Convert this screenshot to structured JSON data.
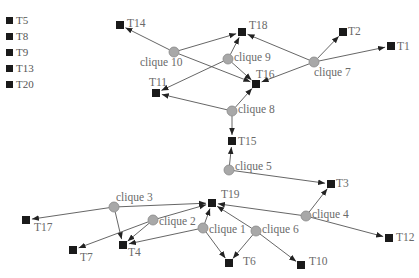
{
  "legend": {
    "items": [
      {
        "label": "T5"
      },
      {
        "label": "T8"
      },
      {
        "label": "T9"
      },
      {
        "label": "T13"
      },
      {
        "label": "T20"
      }
    ]
  },
  "colors": {
    "task_node": "#1a1a1a",
    "clique_node": "#a8a8a8",
    "clique_stroke": "#888888",
    "edge": "#555555",
    "label": "#6a6a6a"
  },
  "task_nodes": [
    {
      "id": "T1",
      "label": "T1",
      "x": 391,
      "y": 46,
      "lx": 397,
      "ly": 50,
      "anchor": "start"
    },
    {
      "id": "T2",
      "label": "T2",
      "x": 343,
      "y": 32,
      "lx": 348,
      "ly": 35,
      "anchor": "start"
    },
    {
      "id": "T3",
      "label": "T3",
      "x": 331,
      "y": 184,
      "lx": 336,
      "ly": 187,
      "anchor": "start"
    },
    {
      "id": "T4",
      "label": "T4",
      "x": 123,
      "y": 245,
      "lx": 128,
      "ly": 256,
      "anchor": "start"
    },
    {
      "id": "T6",
      "label": "T6",
      "x": 229,
      "y": 263,
      "lx": 243,
      "ly": 265,
      "anchor": "start"
    },
    {
      "id": "T7",
      "label": "T7",
      "x": 73,
      "y": 250,
      "lx": 80,
      "ly": 261,
      "anchor": "start"
    },
    {
      "id": "T10",
      "label": "T10",
      "x": 301,
      "y": 265,
      "lx": 309,
      "ly": 265,
      "anchor": "start"
    },
    {
      "id": "T11",
      "label": "T11",
      "x": 156,
      "y": 93,
      "lx": 149,
      "ly": 86,
      "anchor": "start"
    },
    {
      "id": "T12",
      "label": "T12",
      "x": 389,
      "y": 238,
      "lx": 396,
      "ly": 241,
      "anchor": "start"
    },
    {
      "id": "T14",
      "label": "T14",
      "x": 120,
      "y": 25,
      "lx": 127,
      "ly": 27,
      "anchor": "start"
    },
    {
      "id": "T15",
      "label": "T15",
      "x": 232,
      "y": 141,
      "lx": 238,
      "ly": 145,
      "anchor": "start"
    },
    {
      "id": "T16",
      "label": "T16",
      "x": 256,
      "y": 84,
      "lx": 256,
      "ly": 78,
      "anchor": "start"
    },
    {
      "id": "T17",
      "label": "T17",
      "x": 26,
      "y": 220,
      "lx": 34,
      "ly": 231,
      "anchor": "start"
    },
    {
      "id": "T18",
      "label": "T18",
      "x": 242,
      "y": 32,
      "lx": 249,
      "ly": 29,
      "anchor": "start"
    },
    {
      "id": "T19",
      "label": "T19",
      "x": 212,
      "y": 203,
      "lx": 221,
      "ly": 198,
      "anchor": "start"
    }
  ],
  "clique_nodes": [
    {
      "id": "c1",
      "label": "clique 1",
      "x": 203,
      "y": 228,
      "lx": 209,
      "ly": 233,
      "anchor": "start"
    },
    {
      "id": "c2",
      "label": "clique 2",
      "x": 153,
      "y": 220,
      "lx": 159,
      "ly": 225,
      "anchor": "start"
    },
    {
      "id": "c3",
      "label": "clique 3",
      "x": 114,
      "y": 207,
      "lx": 116,
      "ly": 201,
      "anchor": "start"
    },
    {
      "id": "c4",
      "label": "clique 4",
      "x": 306,
      "y": 216,
      "lx": 312,
      "ly": 218,
      "anchor": "start"
    },
    {
      "id": "c5",
      "label": "clique 5",
      "x": 229,
      "y": 170,
      "lx": 235,
      "ly": 170,
      "anchor": "start"
    },
    {
      "id": "c6",
      "label": "clique 6",
      "x": 256,
      "y": 231,
      "lx": 262,
      "ly": 233,
      "anchor": "start"
    },
    {
      "id": "c7",
      "label": "clique 7",
      "x": 314,
      "y": 62,
      "lx": 314,
      "ly": 76,
      "anchor": "start"
    },
    {
      "id": "c8",
      "label": "clique 8",
      "x": 232,
      "y": 111,
      "lx": 238,
      "ly": 113,
      "anchor": "start"
    },
    {
      "id": "c9",
      "label": "clique 9",
      "x": 228,
      "y": 59,
      "lx": 234,
      "ly": 61,
      "anchor": "start"
    },
    {
      "id": "c10",
      "label": "clique 10",
      "x": 174,
      "y": 52,
      "lx": 140,
      "ly": 66,
      "anchor": "start"
    }
  ],
  "edges": [
    {
      "from": "c10",
      "to": "T14"
    },
    {
      "from": "c10",
      "to": "T18"
    },
    {
      "from": "c10",
      "to": "T16"
    },
    {
      "from": "c9",
      "to": "T18"
    },
    {
      "from": "c9",
      "to": "T16"
    },
    {
      "from": "c9",
      "to": "T11"
    },
    {
      "from": "c7",
      "to": "T18"
    },
    {
      "from": "c7",
      "to": "T2"
    },
    {
      "from": "c7",
      "to": "T1"
    },
    {
      "from": "c7",
      "to": "T16"
    },
    {
      "from": "c8",
      "to": "T16"
    },
    {
      "from": "c8",
      "to": "T11"
    },
    {
      "from": "c8",
      "to": "T15"
    },
    {
      "from": "c5",
      "to": "T15"
    },
    {
      "from": "c5",
      "to": "T3"
    },
    {
      "from": "c4",
      "to": "T3"
    },
    {
      "from": "c4",
      "to": "T19"
    },
    {
      "from": "c4",
      "to": "T12"
    },
    {
      "from": "c3",
      "to": "T17"
    },
    {
      "from": "c3",
      "to": "T4"
    },
    {
      "from": "c3",
      "to": "T19"
    },
    {
      "from": "c2",
      "to": "T7"
    },
    {
      "from": "c2",
      "to": "T4"
    },
    {
      "from": "c2",
      "to": "T19"
    },
    {
      "from": "c1",
      "to": "T4"
    },
    {
      "from": "c1",
      "to": "T19"
    },
    {
      "from": "c1",
      "to": "T6"
    },
    {
      "from": "c6",
      "to": "T19"
    },
    {
      "from": "c6",
      "to": "T6"
    },
    {
      "from": "c6",
      "to": "T10"
    }
  ]
}
